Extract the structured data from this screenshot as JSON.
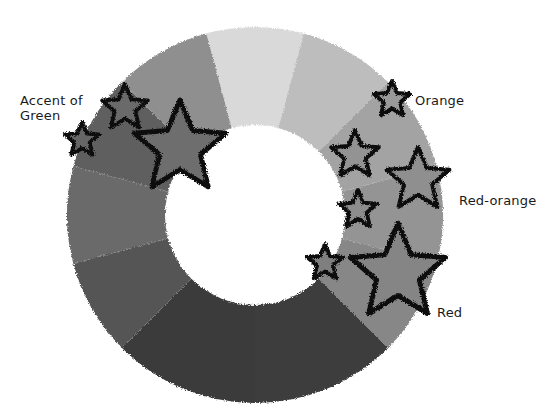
{
  "diagram": {
    "type": "color-wheel-donut",
    "center": [
      255,
      215
    ],
    "outer_radius": 188,
    "inner_radius": 90,
    "segments": [
      {
        "start": -105,
        "end": -75,
        "color": "#d9d9d9"
      },
      {
        "start": -75,
        "end": -45,
        "color": "#bdbdbd"
      },
      {
        "start": -45,
        "end": -15,
        "color": "#a3a3a3"
      },
      {
        "start": -15,
        "end": 15,
        "color": "#949494"
      },
      {
        "start": 15,
        "end": 45,
        "color": "#878787"
      },
      {
        "start": 45,
        "end": 90,
        "color": "#3e3e3e"
      },
      {
        "start": 90,
        "end": 135,
        "color": "#3a3a3a"
      },
      {
        "start": 135,
        "end": 165,
        "color": "#555555"
      },
      {
        "start": 165,
        "end": 195,
        "color": "#6b6b6b"
      },
      {
        "start": 195,
        "end": 225,
        "color": "#5f5f5f"
      },
      {
        "start": 225,
        "end": 255,
        "color": "#8f8f8f"
      }
    ],
    "stars": [
      {
        "x": 125,
        "y": 108,
        "r": 24,
        "color": "#6b6b6b"
      },
      {
        "x": 82,
        "y": 140,
        "r": 18,
        "color": "#666666"
      },
      {
        "x": 180,
        "y": 148,
        "r": 48,
        "color": "#6e6e6e"
      },
      {
        "x": 392,
        "y": 100,
        "r": 19,
        "color": "#9a9a9a"
      },
      {
        "x": 355,
        "y": 155,
        "r": 25,
        "color": "#939393"
      },
      {
        "x": 418,
        "y": 180,
        "r": 33,
        "color": "#8f8f8f"
      },
      {
        "x": 358,
        "y": 210,
        "r": 20,
        "color": "#8d8d8d"
      },
      {
        "x": 325,
        "y": 263,
        "r": 19,
        "color": "#7f7f7f"
      },
      {
        "x": 398,
        "y": 273,
        "r": 50,
        "color": "#858585"
      }
    ]
  },
  "labels": {
    "accent_of_green": "Accent of\nGreen",
    "orange": "Orange",
    "red_orange": "Red-orange",
    "red": "Red"
  }
}
